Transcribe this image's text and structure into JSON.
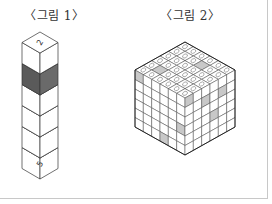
{
  "figures": [
    {
      "caption": "〈그림 1〉",
      "type": "vertical column of 6 stacked cubes (isometric)",
      "cube_count": 6,
      "top_face_label": "2",
      "bottom_face_label": "5",
      "shaded_cube_index": 1,
      "shade_colors": {
        "top": "#000000",
        "left": "#5a5a5a",
        "right": "#6a6a6a"
      }
    },
    {
      "caption": "〈그림 2〉",
      "type": "6x6x6 isometric cube with numbered top face",
      "grid_size": 6,
      "top_shaded_cells": [
        [
          3,
          1
        ],
        [
          1,
          4
        ]
      ],
      "left_shaded_cells": [
        [
          0,
          0
        ],
        [
          3,
          5
        ],
        [
          5,
          3
        ]
      ],
      "right_shaded_cells": [
        [
          0,
          0
        ],
        [
          1,
          2
        ],
        [
          1,
          4
        ],
        [
          3,
          3
        ]
      ],
      "shade_color": "#c8c8c8"
    }
  ]
}
